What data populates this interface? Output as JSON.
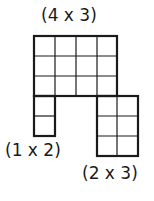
{
  "labels": {
    "top": "(4 x 3)",
    "left": "(1 x 2)",
    "right": "(2 x 3)"
  },
  "grids": [
    {
      "name": "grid-4x3",
      "cols": 4,
      "rows": 3
    },
    {
      "name": "grid-1x2",
      "cols": 1,
      "rows": 2
    },
    {
      "name": "grid-2x3",
      "cols": 2,
      "rows": 3
    }
  ],
  "colors": {
    "stroke": "#1a1a1a",
    "background": "#ffffff"
  }
}
